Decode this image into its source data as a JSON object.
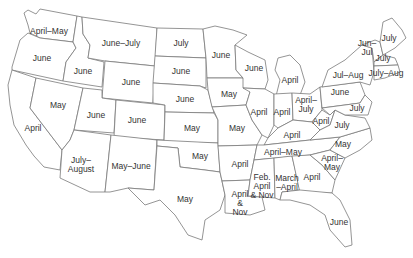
{
  "map": {
    "type": "US state map",
    "line_color": "#7a7a7a",
    "text_color": "#333333",
    "background": "#ffffff",
    "labels": [
      {
        "state": "Washington",
        "text": "April–May",
        "x": 49,
        "y": 31
      },
      {
        "state": "Oregon",
        "text": "June",
        "x": 42,
        "y": 58
      },
      {
        "state": "California",
        "text": "April",
        "x": 33,
        "y": 128
      },
      {
        "state": "Idaho",
        "text": "June",
        "x": 83,
        "y": 71
      },
      {
        "state": "Nevada",
        "text": "May",
        "x": 58,
        "y": 105
      },
      {
        "state": "Montana",
        "text": "June–July",
        "x": 121,
        "y": 43
      },
      {
        "state": "Wyoming",
        "text": "June",
        "x": 131,
        "y": 82
      },
      {
        "state": "Utah",
        "text": "June",
        "x": 96,
        "y": 115
      },
      {
        "state": "Colorado",
        "text": "June",
        "x": 137,
        "y": 120
      },
      {
        "state": "Arizona",
        "text": "July–\nAugust",
        "x": 81,
        "y": 165
      },
      {
        "state": "New Mexico",
        "text": "May–June",
        "x": 131,
        "y": 166
      },
      {
        "state": "North Dakota",
        "text": "July",
        "x": 181,
        "y": 43
      },
      {
        "state": "South Dakota",
        "text": "June",
        "x": 181,
        "y": 71
      },
      {
        "state": "Nebraska",
        "text": "June",
        "x": 185,
        "y": 99
      },
      {
        "state": "Kansas",
        "text": "May",
        "x": 192,
        "y": 128
      },
      {
        "state": "Oklahoma",
        "text": "May",
        "x": 200,
        "y": 156
      },
      {
        "state": "Texas",
        "text": "May",
        "x": 185,
        "y": 199
      },
      {
        "state": "Minnesota",
        "text": "June",
        "x": 221,
        "y": 55
      },
      {
        "state": "Iowa",
        "text": "May",
        "x": 229,
        "y": 94
      },
      {
        "state": "Missouri",
        "text": "May",
        "x": 237,
        "y": 128
      },
      {
        "state": "Arkansas",
        "text": "April",
        "x": 240,
        "y": 164
      },
      {
        "state": "Louisiana",
        "text": "April\n&\nNov",
        "x": 240,
        "y": 203
      },
      {
        "state": "Wisconsin",
        "text": "June",
        "x": 254,
        "y": 68
      },
      {
        "state": "Illinois",
        "text": "April",
        "x": 259,
        "y": 112
      },
      {
        "state": "Michigan",
        "text": "April",
        "x": 290,
        "y": 80
      },
      {
        "state": "Indiana",
        "text": "April",
        "x": 282,
        "y": 112
      },
      {
        "state": "Ohio",
        "text": "April–\nJuly",
        "x": 306,
        "y": 105
      },
      {
        "state": "Kentucky",
        "text": "April",
        "x": 292,
        "y": 135
      },
      {
        "state": "Tennessee",
        "text": "April–May",
        "x": 283,
        "y": 152
      },
      {
        "state": "Mississippi",
        "text": "Feb.\nApril\n& Nov",
        "x": 262,
        "y": 186
      },
      {
        "state": "Alabama",
        "text": "March\n–April",
        "x": 287,
        "y": 183
      },
      {
        "state": "Georgia",
        "text": "April",
        "x": 312,
        "y": 177
      },
      {
        "state": "Florida",
        "text": "June",
        "x": 339,
        "y": 222
      },
      {
        "state": "South Carolina",
        "text": "April–\nMay",
        "x": 332,
        "y": 163
      },
      {
        "state": "North Carolina",
        "text": "May",
        "x": 343,
        "y": 144
      },
      {
        "state": "West Virginia",
        "text": "April",
        "x": 321,
        "y": 121
      },
      {
        "state": "Virginia",
        "text": "July",
        "x": 342,
        "y": 125
      },
      {
        "state": "Pennsylvania",
        "text": "June",
        "x": 340,
        "y": 92
      },
      {
        "state": "New York",
        "text": "Jul–Aug",
        "x": 348,
        "y": 75
      },
      {
        "state": "Maryland/Delaware",
        "text": "July",
        "x": 357,
        "y": 108
      },
      {
        "state": "Vermont/New Hampshire",
        "text": "Jun–\nJul",
        "x": 367,
        "y": 48
      },
      {
        "state": "Maine",
        "text": "July",
        "x": 389,
        "y": 38
      },
      {
        "state": "Massachusetts",
        "text": "July",
        "x": 383,
        "y": 58
      },
      {
        "state": "Connecticut/Rhode Island",
        "text": "July–Aug",
        "x": 386,
        "y": 73
      }
    ]
  }
}
